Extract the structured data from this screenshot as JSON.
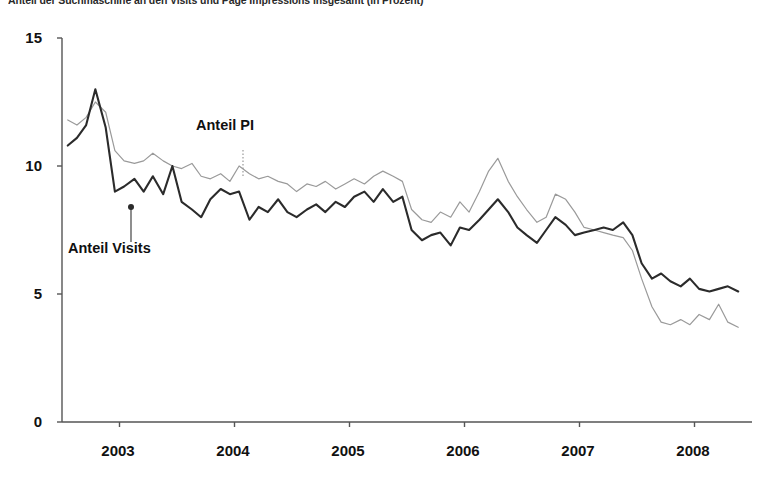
{
  "chart_data": {
    "type": "line",
    "title": "Anteil der Suchmaschine an den Visits und Page Impressions insgesamt (in Prozent)",
    "xlabel": "",
    "ylabel": "",
    "ylim": [
      0,
      15
    ],
    "yticks": [
      0,
      5,
      10,
      15
    ],
    "xlim": [
      2002.5,
      2008.5
    ],
    "xticks": [
      2003,
      2004,
      2005,
      2006,
      2007,
      2008
    ],
    "xtick_labels": [
      "2003",
      "2004",
      "2005",
      "2006",
      "2007",
      "2008"
    ],
    "grid": false,
    "legend_position": "inline-annotations",
    "annotations": [
      {
        "text": "Anteil PI",
        "series": "Anteil PI"
      },
      {
        "text": "Anteil Visits",
        "series": "Anteil Visits"
      }
    ],
    "x": [
      2002.55,
      2002.63,
      2002.71,
      2002.79,
      2002.88,
      2002.96,
      2003.04,
      2003.13,
      2003.21,
      2003.29,
      2003.38,
      2003.46,
      2003.54,
      2003.63,
      2003.71,
      2003.79,
      2003.88,
      2003.96,
      2004.04,
      2004.13,
      2004.21,
      2004.29,
      2004.38,
      2004.46,
      2004.54,
      2004.63,
      2004.71,
      2004.79,
      2004.88,
      2004.96,
      2005.04,
      2005.13,
      2005.21,
      2005.29,
      2005.38,
      2005.46,
      2005.54,
      2005.63,
      2005.71,
      2005.79,
      2005.88,
      2005.96,
      2006.04,
      2006.13,
      2006.21,
      2006.29,
      2006.38,
      2006.46,
      2006.54,
      2006.63,
      2006.71,
      2006.79,
      2006.88,
      2006.96,
      2007.04,
      2007.13,
      2007.21,
      2007.29,
      2007.38,
      2007.46,
      2007.54,
      2007.63,
      2007.71,
      2007.79,
      2007.88,
      2007.96,
      2008.04,
      2008.13,
      2008.21,
      2008.29,
      2008.38
    ],
    "series": [
      {
        "name": "Anteil PI",
        "color": "#9a9a9a",
        "style": "thin-gray",
        "values": [
          11.8,
          11.6,
          11.9,
          12.5,
          12.1,
          10.6,
          10.2,
          10.1,
          10.2,
          10.5,
          10.2,
          10.0,
          9.9,
          10.1,
          9.6,
          9.5,
          9.7,
          9.4,
          10.0,
          9.7,
          9.5,
          9.6,
          9.4,
          9.3,
          9.0,
          9.3,
          9.2,
          9.4,
          9.1,
          9.3,
          9.5,
          9.3,
          9.6,
          9.8,
          9.6,
          9.4,
          8.3,
          7.9,
          7.8,
          8.2,
          8.0,
          8.6,
          8.2,
          9.0,
          9.8,
          10.3,
          9.4,
          8.8,
          8.3,
          7.8,
          8.0,
          8.9,
          8.7,
          8.2,
          7.6,
          7.5,
          7.4,
          7.3,
          7.2,
          6.7,
          5.6,
          4.5,
          3.9,
          3.8,
          4.0,
          3.8,
          4.2,
          4.0,
          4.6,
          3.9,
          3.7
        ]
      },
      {
        "name": "Anteil Visits",
        "color": "#2b2b2b",
        "style": "thick-dark",
        "values": [
          10.8,
          11.1,
          11.6,
          13.0,
          11.5,
          9.0,
          9.2,
          9.5,
          9.0,
          9.6,
          8.9,
          10.0,
          8.6,
          8.3,
          8.0,
          8.7,
          9.1,
          8.9,
          9.0,
          7.9,
          8.4,
          8.2,
          8.7,
          8.2,
          8.0,
          8.3,
          8.5,
          8.2,
          8.6,
          8.4,
          8.8,
          9.0,
          8.6,
          9.1,
          8.6,
          8.8,
          7.5,
          7.1,
          7.3,
          7.4,
          6.9,
          7.6,
          7.5,
          7.9,
          8.3,
          8.7,
          8.2,
          7.6,
          7.3,
          7.0,
          7.5,
          8.0,
          7.7,
          7.3,
          7.4,
          7.5,
          7.6,
          7.5,
          7.8,
          7.3,
          6.2,
          5.6,
          5.8,
          5.5,
          5.3,
          5.6,
          5.2,
          5.1,
          5.2,
          5.3,
          5.1
        ]
      }
    ]
  }
}
